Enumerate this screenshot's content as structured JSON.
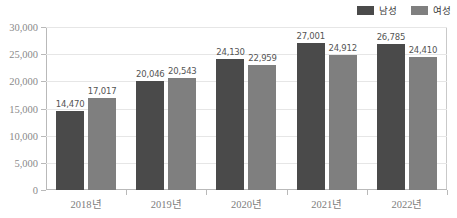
{
  "legend": {
    "position": "top-right",
    "items": [
      {
        "label": "남성",
        "color": "#4a4a4a",
        "icon": "legend-swatch-male"
      },
      {
        "label": "여성",
        "color": "#7f7f7f",
        "icon": "legend-swatch-female"
      }
    ]
  },
  "axis": {
    "y_ticks": [
      "0",
      "5,000",
      "10,000",
      "15,000",
      "20,000",
      "25,000",
      "30,000"
    ],
    "x_ticks": [
      "2018년",
      "2019년",
      "2020년",
      "2021년",
      "2022년"
    ]
  },
  "colors": {
    "male": "#4a4a4a",
    "female": "#7f7f7f",
    "grid": "#e6e6e6",
    "axis": "#b9b9b9",
    "label_text": "#555555",
    "tick_text": "#8a8a8a"
  },
  "chart_data": {
    "type": "bar",
    "title": "",
    "subtitle": "",
    "xlabel": "",
    "ylabel": "",
    "categories": [
      "2018년",
      "2019년",
      "2020년",
      "2021년",
      "2022년"
    ],
    "series": [
      {
        "name": "남성",
        "color": "#4a4a4a",
        "values": [
          14470,
          20046,
          24130,
          27001,
          26785
        ],
        "labels": [
          "14,470",
          "20,046",
          "24,130",
          "27,001",
          "26,785"
        ]
      },
      {
        "name": "여성",
        "color": "#7f7f7f",
        "values": [
          17017,
          20543,
          22959,
          24912,
          24410
        ],
        "labels": [
          "17,017",
          "20,543",
          "22,959",
          "24,912",
          "24,410"
        ]
      }
    ],
    "ylim": [
      0,
      30000
    ],
    "ytick_values": [
      0,
      5000,
      10000,
      15000,
      20000,
      25000,
      30000
    ],
    "ytick_labels": [
      "0",
      "5,000",
      "10,000",
      "15,000",
      "20,000",
      "25,000",
      "30,000"
    ],
    "grid": "horizontal",
    "legend_position": "top-right",
    "data_labels": true
  }
}
